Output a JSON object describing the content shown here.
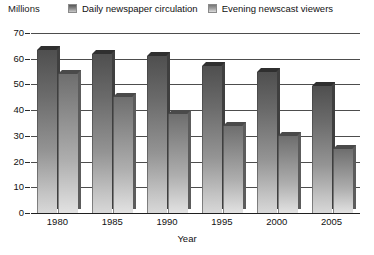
{
  "chart_data": {
    "type": "bar",
    "title": "",
    "subtitle": "",
    "unit_label": "Millions",
    "xlabel": "Year",
    "ylabel": "",
    "categories": [
      "1980",
      "1985",
      "1990",
      "1995",
      "2000",
      "2005"
    ],
    "series": [
      {
        "name": "Daily newspaper circulation",
        "values": [
          63.5,
          62.0,
          61.0,
          57.0,
          55.0,
          49.5
        ],
        "color": "#6b6b6b"
      },
      {
        "name": "Evening newscast viewers",
        "values": [
          54.0,
          45.0,
          38.5,
          34.0,
          30.0,
          25.0
        ],
        "color": "#9a9a9a"
      }
    ],
    "ylim": [
      0,
      70
    ],
    "yticks": [
      0,
      10,
      20,
      30,
      40,
      50,
      60,
      70
    ],
    "ytick_labels": [
      "0",
      "10",
      "20",
      "30",
      "40",
      "50",
      "60",
      "70"
    ],
    "grid": true,
    "grid_axis": "y",
    "legend_position": "top",
    "style": "3d-bar-grayscale-gradient"
  },
  "legend": {
    "items": [
      {
        "label": "Daily newspaper circulation",
        "swatch": "legend-swatch-series-1"
      },
      {
        "label": "Evening newscast viewers",
        "swatch": "legend-swatch-series-2"
      }
    ]
  },
  "axes": {
    "unit": "Millions",
    "x_title": "Year"
  }
}
